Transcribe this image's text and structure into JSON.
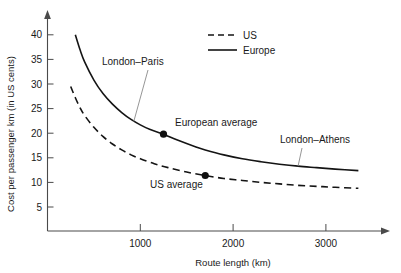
{
  "chart_data": {
    "type": "line",
    "title": "",
    "xlabel": "Route length (km)",
    "ylabel": "Cost per passenger km (in US cents)",
    "xlim": [
      0,
      3400
    ],
    "ylim": [
      0,
      42
    ],
    "xticks": [
      1000,
      2000,
      3000
    ],
    "yticks": [
      5,
      10,
      15,
      20,
      25,
      30,
      35,
      40
    ],
    "grid": false,
    "legend_position": "top-right",
    "series": [
      {
        "name": "Europe",
        "style": "solid",
        "x": [
          300,
          350,
          400,
          500,
          600,
          700,
          800,
          900,
          1000,
          1100,
          1250,
          1400,
          1600,
          1700,
          1900,
          2100,
          2300,
          2500,
          2700,
          2900,
          3100,
          3350
        ],
        "y": [
          40.0,
          37.0,
          34.5,
          30.8,
          28.0,
          25.9,
          24.2,
          22.8,
          21.7,
          20.8,
          19.8,
          18.6,
          17.2,
          16.6,
          15.6,
          14.8,
          14.2,
          13.7,
          13.3,
          13.0,
          12.7,
          12.4
        ]
      },
      {
        "name": "US",
        "style": "dashed",
        "x": [
          250,
          300,
          350,
          400,
          500,
          600,
          700,
          800,
          900,
          1000,
          1150,
          1300,
          1500,
          1700,
          1900,
          2100,
          2300,
          2500,
          2700,
          2900,
          3100,
          3350
        ],
        "y": [
          29.5,
          27.2,
          25.2,
          23.6,
          21.2,
          19.3,
          17.8,
          16.6,
          15.6,
          14.8,
          13.8,
          13.0,
          12.1,
          11.4,
          10.8,
          10.4,
          10.0,
          9.7,
          9.4,
          9.2,
          9.0,
          8.8
        ]
      }
    ],
    "points": [
      {
        "label": "European average",
        "series": "Europe",
        "x": 1250,
        "y": 19.8
      },
      {
        "label": "US average",
        "series": "US",
        "x": 1700,
        "y": 11.4
      }
    ],
    "annotations": [
      {
        "label": "London–Paris",
        "target_x": 930,
        "target_y": 22.4
      },
      {
        "label": "London–Athens",
        "target_x": 2700,
        "target_y": 13.3
      }
    ],
    "legend": [
      {
        "label": "US",
        "style": "dashed"
      },
      {
        "label": "Europe",
        "style": "solid"
      }
    ]
  }
}
